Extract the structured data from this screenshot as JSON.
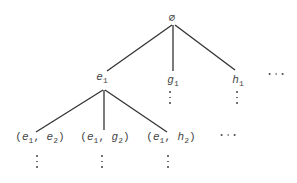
{
  "diagram": {
    "type": "tree",
    "nodes": [
      {
        "id": "root",
        "label": "∅",
        "x": 172,
        "y": 10
      },
      {
        "id": "e1",
        "label": "e",
        "sub": "1",
        "x": 102,
        "y": 72
      },
      {
        "id": "g1",
        "label": "g",
        "sub": "1",
        "x": 172,
        "y": 74
      },
      {
        "id": "h1",
        "label": "h",
        "sub": "1",
        "x": 238,
        "y": 74
      },
      {
        "id": "e1e2",
        "label": "(e1, e2)",
        "x": 37,
        "y": 131
      },
      {
        "id": "e1g2",
        "label": "(e1, g2)",
        "x": 103,
        "y": 131
      },
      {
        "id": "e1h2",
        "label": "(e1, h2)",
        "x": 170,
        "y": 131
      }
    ],
    "edges": [
      {
        "from": "root",
        "to": "e1",
        "x1": 172,
        "y1": 24,
        "x2": 107,
        "y2": 71
      },
      {
        "from": "root",
        "to": "g1",
        "x1": 173,
        "y1": 24,
        "x2": 173,
        "y2": 71
      },
      {
        "from": "root",
        "to": "h1",
        "x1": 175,
        "y1": 24,
        "x2": 235,
        "y2": 71
      },
      {
        "from": "e1",
        "to": "e1e2",
        "x1": 103,
        "y1": 89,
        "x2": 36,
        "y2": 132
      },
      {
        "from": "e1",
        "to": "e1g2",
        "x1": 104,
        "y1": 89,
        "x2": 104,
        "y2": 130
      },
      {
        "from": "e1",
        "to": "e1h2",
        "x1": 105,
        "y1": 89,
        "x2": 167,
        "y2": 132
      }
    ],
    "labels": {
      "root": "∅",
      "e1": {
        "base": "e",
        "sub": "1"
      },
      "g1": {
        "base": "g",
        "sub": "1"
      },
      "h1": {
        "base": "h",
        "sub": "1"
      },
      "child1": {
        "a": "e",
        "a_sub": "1",
        "b": "e",
        "b_sub": "2"
      },
      "child2": {
        "a": "e",
        "a_sub": "1",
        "b": "g",
        "b_sub": "2"
      },
      "child3": {
        "a": "e",
        "a_sub": "1",
        "b": "h",
        "b_sub": "2"
      }
    },
    "ellipses": {
      "level1_more": "...",
      "level2_more": "...",
      "continuation": "⋮"
    },
    "colors": {
      "line": "#333333",
      "text": "#444444",
      "background": "#ffffff"
    }
  }
}
